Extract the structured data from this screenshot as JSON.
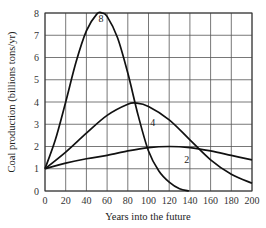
{
  "chart_data": {
    "type": "line",
    "title": "",
    "xlabel": "Years into the future",
    "ylabel": "Coal production (billions tons/yr)",
    "xlim": [
      0,
      200
    ],
    "ylim": [
      0,
      8
    ],
    "grid": true,
    "legend": "none (curves labeled inline)",
    "x_ticks": [
      0,
      20,
      40,
      60,
      80,
      100,
      120,
      140,
      160,
      180,
      200
    ],
    "y_ticks": [
      0,
      1,
      2,
      3,
      4,
      5,
      6,
      7,
      8
    ],
    "series": [
      {
        "name": "8",
        "label_pos": [
          54,
          7.6
        ],
        "x": [
          0,
          10,
          20,
          30,
          40,
          50,
          55,
          60,
          70,
          80,
          90,
          100,
          110,
          120,
          130,
          139
        ],
        "y": [
          1.0,
          2.3,
          4.0,
          5.8,
          7.2,
          7.95,
          8.0,
          7.85,
          6.9,
          5.3,
          3.4,
          1.8,
          0.9,
          0.4,
          0.1,
          0.0
        ]
      },
      {
        "name": "4",
        "label_pos": [
          104,
          2.9
        ],
        "x": [
          0,
          20,
          40,
          60,
          80,
          88,
          100,
          120,
          140,
          160,
          180,
          200
        ],
        "y": [
          1.0,
          1.75,
          2.6,
          3.4,
          3.9,
          3.95,
          3.8,
          3.2,
          2.3,
          1.4,
          0.75,
          0.35
        ]
      },
      {
        "name": "2",
        "label_pos": [
          137,
          1.25
        ],
        "x": [
          0,
          20,
          40,
          60,
          80,
          100,
          120,
          140,
          160,
          180,
          200
        ],
        "y": [
          1.0,
          1.25,
          1.45,
          1.6,
          1.8,
          1.95,
          2.0,
          1.95,
          1.8,
          1.6,
          1.4
        ]
      }
    ]
  }
}
